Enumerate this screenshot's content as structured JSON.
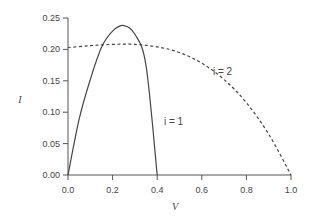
{
  "chart_data": {
    "type": "line",
    "title": "",
    "xlabel": "V",
    "ylabel": "I",
    "xlim": [
      0.0,
      1.0
    ],
    "ylim": [
      0.0,
      0.25
    ],
    "xticks": [
      "0.0",
      "0.2",
      "0.4",
      "0.6",
      "0.8",
      "1.0"
    ],
    "yticks": [
      "0.00",
      "0.05",
      "0.10",
      "0.15",
      "0.20",
      "0.25"
    ],
    "grid": false,
    "legend": "none (inline annotations)",
    "series": [
      {
        "name": "i = 1",
        "style": "solid",
        "x": [
          0.0,
          0.05,
          0.1,
          0.15,
          0.2,
          0.25,
          0.3,
          0.35,
          0.4
        ],
        "y": [
          0.0,
          0.089,
          0.152,
          0.203,
          0.229,
          0.238,
          0.224,
          0.174,
          0.0
        ]
      },
      {
        "name": "i = 2",
        "style": "dashed",
        "x": [
          0.0,
          0.1,
          0.2,
          0.3,
          0.4,
          0.5,
          0.6,
          0.7,
          0.8,
          0.9,
          1.0
        ],
        "y": [
          0.203,
          0.206,
          0.208,
          0.208,
          0.204,
          0.195,
          0.178,
          0.152,
          0.115,
          0.065,
          0.0
        ]
      }
    ],
    "annotations": [
      {
        "text": "i = 1",
        "x": 0.43,
        "y": 0.08
      },
      {
        "text": "i = 2",
        "x": 0.65,
        "y": 0.16
      }
    ]
  }
}
